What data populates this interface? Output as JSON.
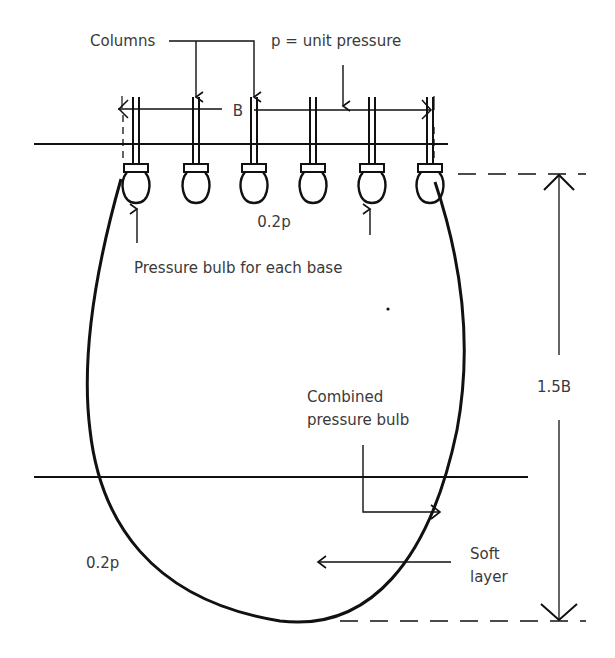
{
  "diagram": {
    "colors": {
      "ink": "#111111",
      "text": "#3a3a3a",
      "background": "#ffffff"
    },
    "labels": {
      "columns": "Columns",
      "unit_pressure": "p = unit pressure",
      "width": "B",
      "bulb_pressure_top": "0.2p",
      "each_base": "Pressure bulb for each base",
      "combined_line1": "Combined",
      "combined_line2": "pressure bulb",
      "depth": "1.5B",
      "bulb_pressure_bottom": "0.2p",
      "soft_line1": "Soft",
      "soft_line2": "layer"
    },
    "column_count": 6
  }
}
